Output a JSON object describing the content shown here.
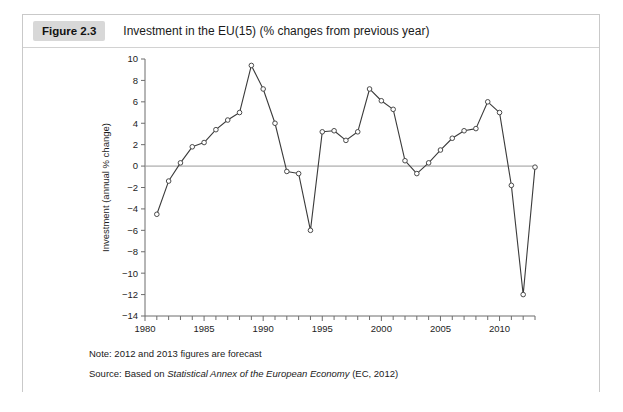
{
  "figure": {
    "badge": "Figure 2.3",
    "title": "Investment in the EU(15) (% changes from previous year)",
    "note": "Note: 2012 and 2013 figures are forecast",
    "source_prefix": "Source: Based on ",
    "source_italic": "Statistical Annex of the European Economy",
    "source_suffix": " (EC, 2012)"
  },
  "colors": {
    "card_border": "#c9c9c9",
    "badge_bg": "#d8d8d8",
    "axis": "#6d6d6d",
    "zero_line": "#9a9a9a",
    "series": "#3b3b3b",
    "marker_fill": "#ffffff"
  },
  "chart_data": {
    "type": "line",
    "title": "Investment in the EU(15) (% changes from previous year)",
    "xlabel": "",
    "ylabel": "Investment (annual % change)",
    "xlim": [
      1980,
      2013
    ],
    "ylim": [
      -14,
      10
    ],
    "yticks": [
      10,
      8,
      6,
      4,
      2,
      0,
      -2,
      -4,
      -6,
      -8,
      -10,
      -12,
      -14
    ],
    "ytick_labels": [
      "10",
      "8",
      "6",
      "4",
      "2",
      "0",
      "-2",
      "-4",
      "-6",
      "-8",
      "-10",
      "-12",
      "-14"
    ],
    "xticks": [
      1980,
      1981,
      1982,
      1983,
      1984,
      1985,
      1986,
      1987,
      1988,
      1989,
      1990,
      1991,
      1992,
      1993,
      1994,
      1995,
      1996,
      1997,
      1998,
      1999,
      2000,
      2001,
      2002,
      2003,
      2004,
      2005,
      2006,
      2007,
      2008,
      2009,
      2010,
      2011,
      2012,
      2013
    ],
    "xtick_labels_major": [
      1980,
      1985,
      1990,
      1995,
      2000,
      2005,
      2010
    ],
    "grid": false,
    "legend": "none",
    "markers": "open-circle",
    "series": [
      {
        "name": "Investment (annual % change)",
        "x": [
          1981,
          1982,
          1983,
          1984,
          1985,
          1986,
          1987,
          1988,
          1989,
          1990,
          1991,
          1992,
          1993,
          1994,
          1995,
          1996,
          1997,
          1998,
          1999,
          2000,
          2001,
          2002,
          2003,
          2004,
          2005,
          2006,
          2007,
          2008,
          2009,
          2010,
          2011,
          2012,
          2013
        ],
        "values": [
          -4.5,
          -1.4,
          0.3,
          1.8,
          2.2,
          3.4,
          4.3,
          5.0,
          9.4,
          7.2,
          4.0,
          -0.5,
          -0.7,
          -6.0,
          3.2,
          3.3,
          2.4,
          3.2,
          7.2,
          6.1,
          5.3,
          0.5,
          -0.7,
          0.3,
          1.5,
          2.6,
          3.3,
          3.5,
          6.0,
          5.0,
          -1.8,
          -12.0,
          -0.1
        ]
      }
    ]
  }
}
